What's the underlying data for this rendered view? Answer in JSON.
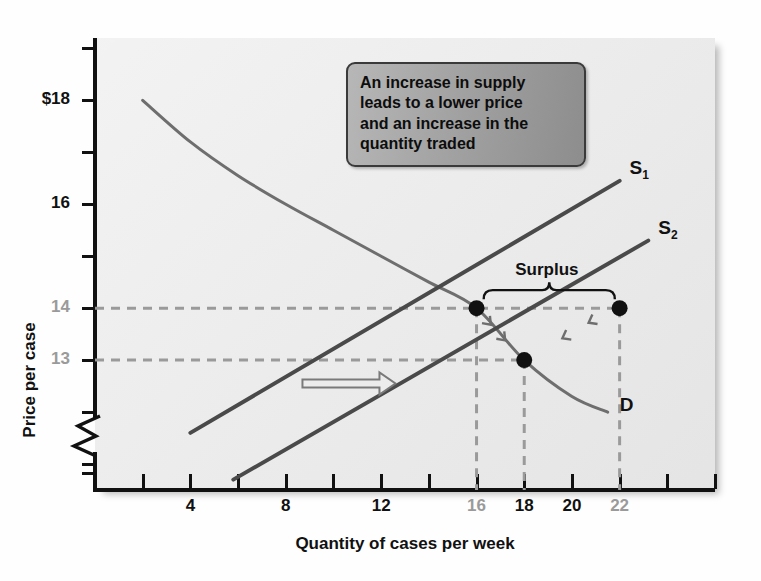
{
  "chart_data": {
    "type": "line",
    "title": "",
    "xlabel": "Quantity of cases per week",
    "ylabel": "Price per case",
    "xlim": [
      0,
      26
    ],
    "ylim": [
      10.5,
      19.2
    ],
    "grid": false,
    "axis_break_y": true,
    "xticks": [
      2,
      4,
      6,
      8,
      10,
      12,
      14,
      16,
      18,
      20,
      22,
      24,
      26
    ],
    "xtick_labels": [
      {
        "value": 4,
        "text": "4",
        "muted": false
      },
      {
        "value": 8,
        "text": "8",
        "muted": false
      },
      {
        "value": 12,
        "text": "12",
        "muted": false
      },
      {
        "value": 16,
        "text": "16",
        "muted": true
      },
      {
        "value": 18,
        "text": "18",
        "muted": false
      },
      {
        "value": 20,
        "text": "20",
        "muted": false
      },
      {
        "value": 22,
        "text": "22",
        "muted": true
      }
    ],
    "yticks": [
      19,
      18,
      17,
      16,
      15,
      14,
      13,
      12,
      11
    ],
    "ytick_labels": [
      {
        "value": 18,
        "text": "$18",
        "muted": false
      },
      {
        "value": 16,
        "text": "16",
        "muted": false
      },
      {
        "value": 14,
        "text": "14",
        "muted": true
      },
      {
        "value": 13,
        "text": "13",
        "muted": true
      }
    ],
    "series": [
      {
        "name": "D",
        "label": "D",
        "kind": "demand-curve",
        "color": "#6e6e6e",
        "points": [
          [
            2,
            18.0
          ],
          [
            4,
            17.2
          ],
          [
            6,
            16.55
          ],
          [
            8,
            16.0
          ],
          [
            10,
            15.5
          ],
          [
            12,
            15.0
          ],
          [
            14,
            14.5
          ],
          [
            16,
            14.0
          ],
          [
            18,
            13.0
          ],
          [
            20,
            12.3
          ],
          [
            21.5,
            12.0
          ]
        ]
      },
      {
        "name": "S1",
        "label": "S₁",
        "kind": "supply-curve-original",
        "color": "#4a4a4a",
        "points": [
          [
            4,
            11.6
          ],
          [
            22,
            16.45
          ]
        ]
      },
      {
        "name": "S2",
        "label": "S₂",
        "kind": "supply-curve-new",
        "color": "#4a4a4a",
        "points": [
          [
            5.8,
            10.7
          ],
          [
            23.2,
            15.3
          ]
        ]
      }
    ],
    "markers": [
      {
        "name": "original-equilibrium",
        "x": 16,
        "y": 14
      },
      {
        "name": "new-equilibrium",
        "x": 18,
        "y": 13
      },
      {
        "name": "surplus-quantity",
        "x": 22,
        "y": 14
      }
    ],
    "guide_lines": [
      {
        "name": "price-14-guide",
        "orientation": "horizontal",
        "value": 14,
        "from": 0,
        "to": 22
      },
      {
        "name": "price-13-guide",
        "orientation": "horizontal",
        "value": 13,
        "from": 0,
        "to": 18
      },
      {
        "name": "qty-16-guide",
        "orientation": "vertical",
        "value": 16,
        "from": 10.5,
        "to": 14
      },
      {
        "name": "qty-18-guide",
        "orientation": "vertical",
        "value": 18,
        "from": 10.5,
        "to": 13
      },
      {
        "name": "qty-22-guide",
        "orientation": "vertical",
        "value": 22,
        "from": 10.5,
        "to": 14
      }
    ],
    "annotations": {
      "surplus_label": "Surplus",
      "surplus_brace_from_x": 16.3,
      "surplus_brace_to_x": 21.8,
      "shift_arrow": {
        "name": "supply-shift-arrow",
        "direction": "right",
        "from_x": 8.7,
        "to_x": 12.6,
        "y": 12.55
      }
    },
    "callout": {
      "lines": [
        "An increase in supply",
        "leads to a lower price",
        "and an increase in the",
        "quantity traded"
      ]
    },
    "colors": {
      "plot_background": "#ececec",
      "axis": "#111111",
      "demand": "#6e6e6e",
      "supply": "#4a4a4a",
      "guide": "#9a9a9a",
      "muted_text": "#9a9a9a",
      "callout_fill": "#a2a2a2"
    }
  }
}
